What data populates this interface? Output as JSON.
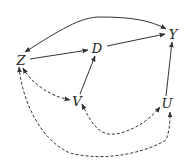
{
  "diagram": {
    "type": "causal-dag",
    "colors": {
      "edge": "#333333",
      "label": "#222222",
      "background": "#ffffff"
    },
    "nodes": [
      {
        "id": "Z",
        "label": "Z",
        "x": 21,
        "y": 60
      },
      {
        "id": "D",
        "label": "D",
        "x": 97,
        "y": 48
      },
      {
        "id": "Y",
        "label": "Y",
        "x": 173,
        "y": 34
      },
      {
        "id": "V",
        "label": "V",
        "x": 77,
        "y": 101
      },
      {
        "id": "U",
        "label": "U",
        "x": 167,
        "y": 103
      }
    ],
    "edges": [
      {
        "from": "Z",
        "to": "D",
        "style": "solid",
        "direction": "directed"
      },
      {
        "from": "D",
        "to": "Y",
        "style": "solid",
        "direction": "directed"
      },
      {
        "from": "V",
        "to": "D",
        "style": "solid",
        "direction": "directed"
      },
      {
        "from": "U",
        "to": "Y",
        "style": "solid",
        "direction": "directed"
      },
      {
        "from": "Z",
        "to": "Y",
        "style": "solid",
        "direction": "bidirected",
        "shape": "arc-above"
      },
      {
        "from": "Z",
        "to": "V",
        "style": "dashed",
        "direction": "bidirected"
      },
      {
        "from": "V",
        "to": "U",
        "style": "dashed",
        "direction": "bidirected",
        "shape": "arc-below"
      },
      {
        "from": "Z",
        "to": "U",
        "style": "dashed",
        "direction": "bidirected",
        "shape": "arc-below"
      }
    ]
  }
}
